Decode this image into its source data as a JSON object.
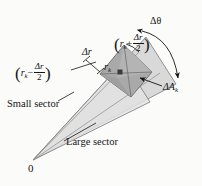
{
  "figure": {
    "background_color": "#fbfbfa",
    "ink_color": "#151515",
    "origin_label": "0",
    "labels": {
      "delta_theta": "Δθ",
      "delta_r": "Δr",
      "r_k": "r",
      "r_k_sub": "k",
      "delta_area": "ΔA",
      "delta_area_sub": "k",
      "small_sector": "Small sector",
      "large_sector": "Large sector"
    },
    "expressions": {
      "outer_radius": {
        "open_paren": "(",
        "base": "r",
        "base_sub": "k",
        "operator": "+",
        "frac_num": "Δr",
        "frac_den": "2",
        "close_paren": ")"
      },
      "inner_radius": {
        "open_paren": "(",
        "base": "r",
        "base_sub": "k",
        "operator": "−",
        "frac_num": "Δr",
        "frac_den": "2",
        "close_paren": ")"
      }
    },
    "shading": {
      "large_sector_fill": "#d9d9d9",
      "small_sector_fill": "#e6e6e6",
      "patch_fill": "#a9a9a9",
      "patch_light_fill": "#c3c3c3",
      "point_marker_fill": "#3a3a3a",
      "stroke": "#6b6b6b"
    },
    "geometry": {
      "origin_x": 33,
      "origin_y": 160,
      "upper_ray_tip_x": 146,
      "upper_ray_tip_y": 37,
      "lower_ray_tip_x": 176,
      "lower_ray_tip_y": 84
    }
  }
}
